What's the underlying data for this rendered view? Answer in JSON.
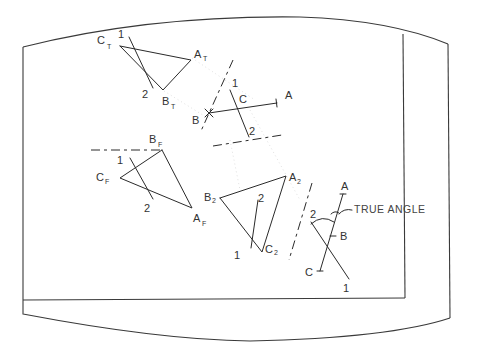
{
  "figure": {
    "type": "descriptive-geometry drawing on CRT-style screen frame",
    "annotation": "TRUE ANGLE",
    "colors": {
      "line": "#2a2a2a",
      "background": "#ffffff",
      "frame": "#3a3a3a"
    }
  },
  "top_view": {
    "labels": {
      "c": "C",
      "c_sub": "T",
      "a": "A",
      "a_sub": "T",
      "b": "B",
      "b_sub": "T",
      "p1": "1",
      "p2": "2"
    }
  },
  "front_view": {
    "labels": {
      "b": "B",
      "b_sub": "F",
      "c": "C",
      "c_sub": "F",
      "a": "A",
      "a_sub": "F",
      "p1": "1",
      "p2": "2"
    }
  },
  "aux_view_1": {
    "labels": {
      "p1": "1",
      "c": "C",
      "a": "A",
      "b": "B",
      "p2": "2"
    }
  },
  "aux_view_2": {
    "labels": {
      "b": "B",
      "b_sub": "2",
      "a": "A",
      "a_sub": "2",
      "c": "C",
      "c_sub": "2",
      "p1": "1",
      "p2": "2"
    }
  },
  "true_angle_view": {
    "labels": {
      "a": "A",
      "b": "B",
      "c": "C",
      "p1": "1",
      "p2": "2",
      "note": "TRUE ANGLE"
    }
  }
}
